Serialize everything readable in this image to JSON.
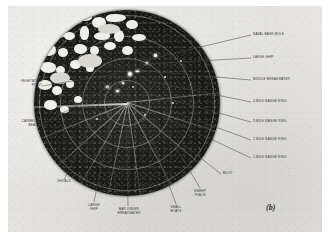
{
  "figure": {
    "caption_marker": "(b)",
    "colors": {
      "plate_background": "#e8e7e4",
      "scope_dark": "#1d1d1b",
      "return_bright": "#efeee9",
      "label_text": "#3a3936"
    }
  },
  "callouts": {
    "right": [
      {
        "id": "naval-base-mole",
        "label": "NAVAL BASE MOLE"
      },
      {
        "id": "large-ship",
        "label": "LARGE SHIP"
      },
      {
        "id": "middle-breakwater",
        "label": "MIDDLE BREAKWATER"
      },
      {
        "id": "range-ring-4",
        "label": "4-MILE RANGE RING"
      },
      {
        "id": "range-ring-3",
        "label": "3-MILE RANGE RING"
      },
      {
        "id": "range-ring-2",
        "label": "2-MILE RANGE RING"
      },
      {
        "id": "range-ring-1",
        "label": "1-MILE RANGE RING"
      },
      {
        "id": "buoy",
        "label": "BUOY"
      }
    ],
    "left": [
      {
        "id": "vegetation-point",
        "label_line1": "VEGETATION",
        "label_line2": "POINT"
      },
      {
        "id": "carmello-beach",
        "label_line1": "CARMELLO",
        "label_line2": "BEACH"
      }
    ],
    "bottom": [
      {
        "id": "shoals",
        "label_line1": "SHOALS",
        "label_line2": ""
      },
      {
        "id": "large-ship-bottom",
        "label_line1": "LARGE",
        "label_line2": "SHIP"
      },
      {
        "id": "bar-under-breakwater",
        "label_line1": "BAR UNDER",
        "label_line2": "BREAKWATER"
      },
      {
        "id": "small-boats",
        "label_line1": "SMALL",
        "label_line2": "BOATS"
      },
      {
        "id": "sweep-trace",
        "label_line1": "SWEEP",
        "label_line2": "TRACE"
      }
    ]
  },
  "scope": {
    "range_rings": [
      "1-MILE",
      "2-MILE",
      "3-MILE",
      "4-MILE"
    ],
    "ring_count": 4,
    "bearing_spokes": 9,
    "sweep_present": true
  }
}
